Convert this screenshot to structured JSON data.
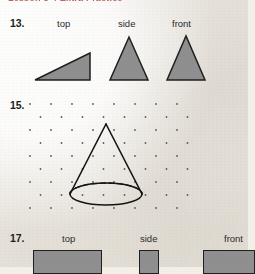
{
  "page": {
    "background_color": "#f2efe9",
    "width": 248,
    "height": 267,
    "header": {
      "text": "Lesson 5-4  Extra Practice",
      "color": "#a02a22",
      "cropped": true
    }
  },
  "problems": [
    {
      "number": "13.",
      "kind": "three-view-drawing",
      "view_labels": [
        "top",
        "side",
        "front"
      ],
      "label_positions_x": [
        57,
        118,
        172
      ],
      "shapes": [
        {
          "name": "right-triangle-top-view",
          "type": "triangle",
          "points": "35,80 90,80 90,53",
          "fill": "#8f8f8f",
          "stroke": "#1f1f1f"
        },
        {
          "name": "isosceles-triangle-side-view",
          "type": "triangle",
          "points": "110,80 148,80 129,37",
          "fill": "#8f8f8f",
          "stroke": "#1f1f1f"
        },
        {
          "name": "isosceles-triangle-front-view",
          "type": "triangle",
          "points": "167,80 205,80 186,36",
          "fill": "#8f8f8f",
          "stroke": "#1f1f1f"
        }
      ]
    },
    {
      "number": "15.",
      "kind": "isometric-dot-grid-drawing",
      "grid": {
        "name": "isometric-dot-grid",
        "columns": 8,
        "rows": 9,
        "spacing_x": 21,
        "spacing_y": 13,
        "stagger_x": 10.5,
        "origin_x": 30,
        "origin_y": 104,
        "dot_color": "#5d5a55",
        "dot_radius": 0.9
      },
      "shape": {
        "name": "cone",
        "type": "cone",
        "apex": [
          106,
          124
        ],
        "base_center": [
          106,
          194
        ],
        "base_rx": 36,
        "base_ry": 11,
        "stroke": "#141414",
        "hidden_edge": "dashed-back-ellipse-half"
      }
    },
    {
      "number": "17.",
      "kind": "three-view-drawing",
      "view_labels": [
        "top",
        "side",
        "front"
      ],
      "label_positions_x": [
        62,
        140,
        224
      ],
      "shapes": [
        {
          "name": "rectangle-top-view",
          "type": "rectangle",
          "x": 33,
          "y": 250,
          "width": 69,
          "height": 24,
          "fill": "#8f8f8f",
          "stroke": "#1f1f1f"
        },
        {
          "name": "rectangle-side-view",
          "type": "rectangle",
          "x": 139,
          "y": 250,
          "width": 20,
          "height": 24,
          "fill": "#8f8f8f",
          "stroke": "#1f1f1f"
        },
        {
          "name": "rectangle-front-view",
          "type": "rectangle",
          "x": 203,
          "y": 250,
          "width": 52,
          "height": 24,
          "fill": "#8f8f8f",
          "stroke": "#1f1f1f"
        }
      ]
    }
  ]
}
